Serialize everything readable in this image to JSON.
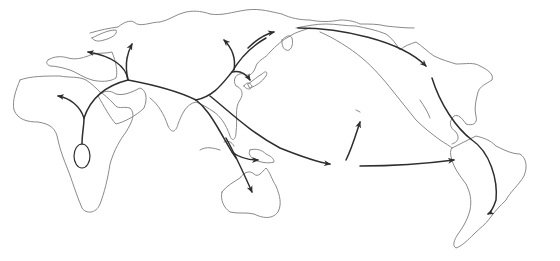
{
  "map": {
    "type": "human-migration-routes",
    "style": {
      "background": "#ffffff",
      "coastline_color": "#8a8a8a",
      "route_color": "#2e2e2e"
    },
    "regions": [
      "north-america",
      "south-america",
      "europe",
      "africa",
      "asia",
      "japan",
      "southeast-asia",
      "new-guinea",
      "australia",
      "pacific-island"
    ],
    "origin": "east-africa",
    "routes": [
      {
        "name": "africa-to-north-africa",
        "direction": "north-west"
      },
      {
        "name": "middle-east-to-europe-west",
        "direction": "west"
      },
      {
        "name": "middle-east-to-europe-north",
        "direction": "north"
      },
      {
        "name": "asia-to-siberia-north",
        "direction": "north-west"
      },
      {
        "name": "asia-to-beringia",
        "direction": "north-east"
      },
      {
        "name": "asia-to-japan",
        "direction": "east"
      },
      {
        "name": "southeast-asia-to-australia",
        "direction": "south"
      },
      {
        "name": "southeast-asia-to-new-guinea",
        "direction": "east"
      },
      {
        "name": "pacific-crossing",
        "direction": "east"
      },
      {
        "name": "pacific-to-hawaii",
        "direction": "north"
      },
      {
        "name": "pacific-to-south-america",
        "direction": "east"
      },
      {
        "name": "beringia-to-north-america",
        "direction": "south-east"
      },
      {
        "name": "north-to-south-america",
        "direction": "south"
      }
    ]
  }
}
